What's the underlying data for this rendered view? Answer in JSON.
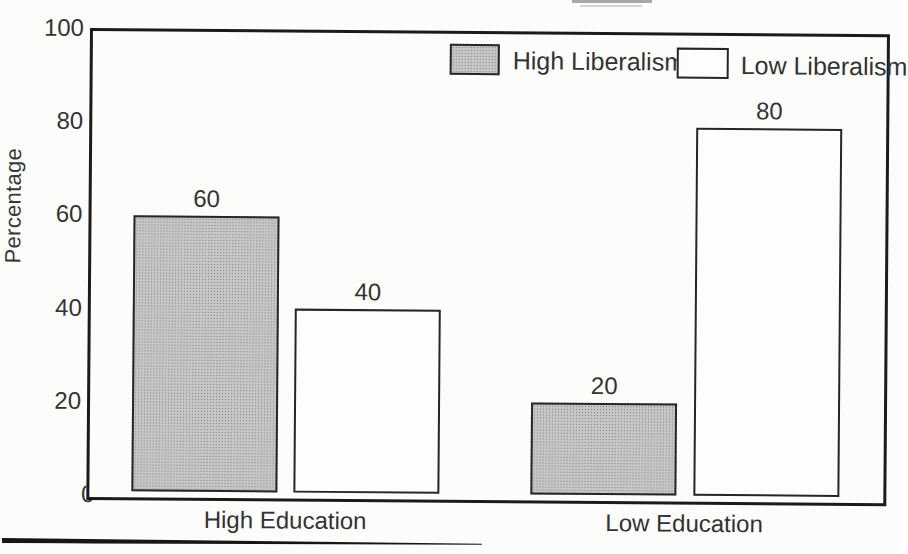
{
  "chart_data": {
    "type": "bar",
    "title": "",
    "categories": [
      "High Education",
      "Low Education"
    ],
    "series": [
      {
        "name": "High Liberalism",
        "fill": "gray-halftone",
        "values": [
          60,
          20
        ]
      },
      {
        "name": "Low Liberalism",
        "fill": "white",
        "values": [
          40,
          80
        ]
      }
    ],
    "xlabel": "",
    "ylabel": "Percentage",
    "ylim": [
      0,
      100
    ],
    "yticks": [
      0,
      20,
      40,
      60,
      80,
      100
    ],
    "bar_value_labels": [
      60,
      40,
      20,
      80
    ],
    "grid": "off",
    "legend_position": "top-inside",
    "colors": {
      "gray_fill": "#b5b5b5",
      "white_fill": "#fdfdfc",
      "outline": "#1b1b1b",
      "paper": "#fcfcfa"
    }
  }
}
